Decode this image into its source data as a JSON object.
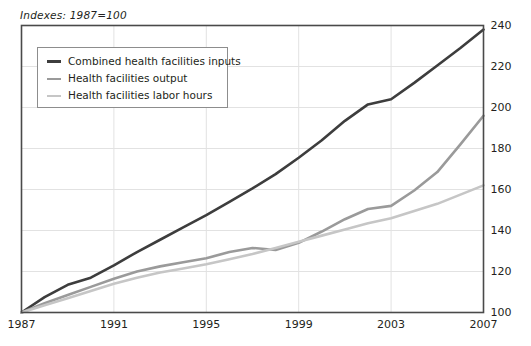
{
  "chart_data": {
    "type": "line",
    "title": "",
    "subtitle": "Indexes: 1987=100",
    "xlabel": "",
    "ylabel": "",
    "xlim": [
      1987,
      2007
    ],
    "ylim": [
      100,
      240
    ],
    "grid": true,
    "grid_axis": "y",
    "legend_position": "top-left inside plot",
    "xticks": [
      "1987",
      "1991",
      "1995",
      "1999",
      "2003",
      "2007"
    ],
    "xtick_values": [
      1987,
      1991,
      1995,
      1999,
      2003,
      2007
    ],
    "yticks": [
      "100",
      "120",
      "140",
      "160",
      "180",
      "200",
      "220",
      "240"
    ],
    "ytick_values": [
      100,
      120,
      140,
      160,
      180,
      200,
      220,
      240
    ],
    "x": [
      1987,
      1988,
      1989,
      1990,
      1991,
      1992,
      1993,
      1994,
      1995,
      1996,
      1997,
      1998,
      1999,
      2000,
      2001,
      2002,
      2003,
      2004,
      2005,
      2006,
      2007
    ],
    "series": [
      {
        "name": "Combined health facilities inputs",
        "color": "#3d3d3d",
        "width": 2.6,
        "values": [
          100.0,
          107.5,
          113.5,
          117.0,
          123.0,
          129.5,
          135.5,
          141.5,
          147.5,
          154.0,
          160.5,
          167.5,
          175.5,
          184.0,
          193.5,
          201.5,
          204.0,
          212.0,
          220.5,
          229.0,
          238.0
        ]
      },
      {
        "name": "Health facilities output",
        "color": "#9a9a9a",
        "width": 2.6,
        "values": [
          100.0,
          104.5,
          108.5,
          112.5,
          116.5,
          120.0,
          122.5,
          124.5,
          126.5,
          129.5,
          131.5,
          130.5,
          134.0,
          139.5,
          145.5,
          150.5,
          152.0,
          159.5,
          168.5,
          182.0,
          196.0
        ]
      },
      {
        "name": "Health facilities labor hours",
        "color": "#c6c6c6",
        "width": 2.6,
        "values": [
          100.0,
          103.5,
          107.0,
          110.5,
          114.0,
          117.0,
          119.5,
          121.5,
          123.5,
          126.0,
          128.5,
          131.5,
          134.5,
          137.5,
          140.5,
          143.5,
          146.0,
          149.5,
          153.0,
          157.5,
          162.0
        ]
      }
    ]
  },
  "legend": {
    "items": [
      {
        "label": "Combined health facilities inputs"
      },
      {
        "label": "Health facilities output"
      },
      {
        "label": "Health facilities labor hours"
      }
    ]
  }
}
